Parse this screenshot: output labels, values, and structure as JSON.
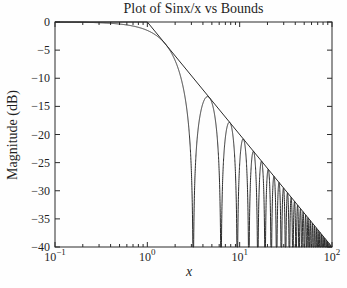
{
  "figure": {
    "title": "Plot of Sinx/x vs Bounds",
    "xlabel": "x",
    "ylabel": "Magnitude (dB)"
  },
  "chart_data": {
    "type": "line",
    "title": "Plot of Sinx/x vs Bounds",
    "xlabel": "x",
    "ylabel": "Magnitude (dB)",
    "x_scale": "log10",
    "xlim": [
      0.1,
      100
    ],
    "ylim": [
      -40,
      0
    ],
    "grid": false,
    "legend": null,
    "line_color": "#2b2b2b",
    "background_color": "#fefefe",
    "yticks": [
      0,
      -5,
      -10,
      -15,
      -20,
      -25,
      -30,
      -35,
      -40
    ],
    "ytick_labels": [
      "0",
      "−5",
      "−10",
      "−15",
      "−20",
      "−25",
      "−30",
      "−35",
      "−40"
    ],
    "xticks": [
      0.1,
      1,
      10,
      100
    ],
    "xtick_labels": [
      {
        "base": "10",
        "exp": "−1"
      },
      {
        "base": "10",
        "exp": "0"
      },
      {
        "base": "10",
        "exp": "1"
      },
      {
        "base": "10",
        "exp": "2"
      }
    ],
    "x_minor_ticks_per_decade": [
      2,
      3,
      4,
      5,
      6,
      7,
      8,
      9
    ],
    "series": [
      {
        "name": "sinc-magnitude",
        "kind": "sampled_function",
        "formula": "y = 20*log10(|sin(x)/x|)",
        "x_domain": [
          0.1,
          100
        ],
        "clip_min_db": -40,
        "nulls_at": "x = n*pi",
        "touches_bound_at": "x = pi/2 + n*pi",
        "samples": 4000
      },
      {
        "name": "upper-bound-flat",
        "kind": "polyline",
        "formula": "y = 0 dB",
        "points": [
          [
            0.1,
            0
          ],
          [
            1,
            0
          ]
        ]
      },
      {
        "name": "upper-bound-rolloff",
        "kind": "polyline",
        "formula": "y = -20*log10(x) dB",
        "points": [
          [
            1,
            0
          ],
          [
            100,
            -40
          ]
        ]
      }
    ]
  }
}
